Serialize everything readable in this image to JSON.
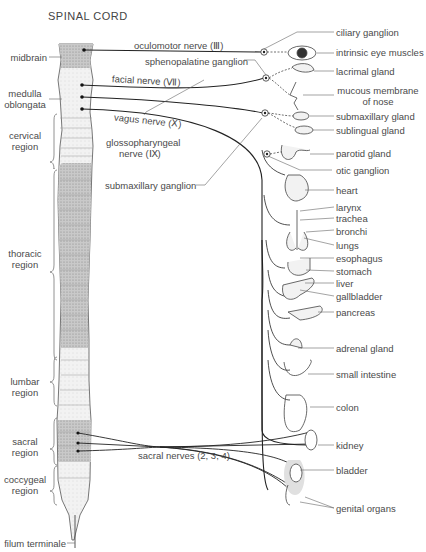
{
  "title": "SPINAL CORD",
  "cord_regions": [
    {
      "id": "midbrain",
      "label": "midbrain"
    },
    {
      "id": "medulla",
      "label": "medulla oblongata"
    },
    {
      "id": "cervical",
      "label": "cervical region"
    },
    {
      "id": "thoracic",
      "label": "thoracic region"
    },
    {
      "id": "lumbar",
      "label": "lumbar region"
    },
    {
      "id": "sacral",
      "label": "sacral region"
    },
    {
      "id": "coccygeal",
      "label": "coccygeal region"
    },
    {
      "id": "filum",
      "label": "filum terminale"
    }
  ],
  "labels": {
    "midbrain": "midbrain",
    "medulla_1": "medulla",
    "medulla_2": "oblongata",
    "cervical_1": "cervical",
    "cervical_2": "region",
    "thoracic_1": "thoracic",
    "thoracic_2": "region",
    "lumbar_1": "lumbar",
    "lumbar_2": "region",
    "sacral_1": "sacral",
    "sacral_2": "region",
    "coccygeal_1": "coccygeal",
    "coccygeal_2": "region",
    "filum": "filum terminale"
  },
  "nerves": {
    "oculomotor": "oculomotor nerve (Ⅲ)",
    "facial": "facial nerve (Ⅶ)",
    "vagus": "vagus nerve (Ⅹ)",
    "glosso_1": "glossopharyngeal",
    "glosso_2": "nerve (Ⅸ)",
    "sacral": "sacral nerves (2, 3, 4)"
  },
  "ganglia": {
    "sphenopalatine": "sphenopalatine ganglion",
    "submaxillary": "submaxillary ganglion",
    "ciliary": "ciliary ganglion",
    "otic": "otic ganglion"
  },
  "organs": {
    "eye_muscles": "intrinsic eye muscles",
    "lacrimal": "lacrimal gland",
    "mucous_1": "mucous membrane",
    "mucous_2": "of nose",
    "submaxillary_gland": "submaxillary gland",
    "sublingual": "sublingual gland",
    "parotid": "parotid gland",
    "heart": "heart",
    "larynx": "larynx",
    "trachea": "trachea",
    "bronchi": "bronchi",
    "lungs": "lungs",
    "esophagus": "esophagus",
    "stomach": "stomach",
    "liver": "liver",
    "gallbladder": "gallbladder",
    "pancreas": "pancreas",
    "adrenal": "adrenal gland",
    "small_intestine": "small intestine",
    "colon": "colon",
    "kidney": "kidney",
    "bladder": "bladder",
    "genital": "genital organs"
  }
}
